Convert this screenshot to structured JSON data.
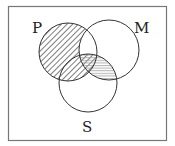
{
  "diagram": {
    "type": "venn",
    "sets": [
      {
        "label": "P",
        "cx": 68,
        "cy": 52,
        "r": 29
      },
      {
        "label": "M",
        "cx": 109,
        "cy": 50,
        "r": 30
      },
      {
        "label": "S",
        "cx": 88,
        "cy": 83,
        "r": 29
      }
    ],
    "labels": {
      "p": "P",
      "m": "M",
      "s": "S"
    },
    "shading": {
      "diagonal": "P minus (P∩M only); includes P∩S",
      "horizontal": "M∩S (including P∩M∩S)",
      "blank": "P∩M outside S"
    },
    "colors": {
      "stroke": "#333333",
      "hatch": "#444444",
      "frame": "#777777"
    }
  }
}
